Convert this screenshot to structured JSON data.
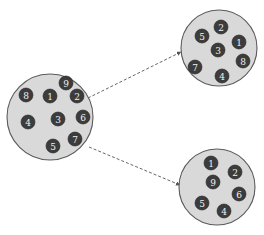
{
  "diagram": {
    "type": "cluster-partition",
    "node_radius": 7,
    "colors": {
      "cluster_fill": "#d9d9d9",
      "cluster_stroke": "#5a5a5a",
      "node_fill": "#3c3c3c",
      "node_text": "#f2f2f2",
      "edge": "#555555"
    },
    "clusters": [
      {
        "id": "source",
        "cx": 50,
        "cy": 117,
        "r": 43,
        "nodes": [
          {
            "label": "9",
            "x": 66,
            "y": 83
          },
          {
            "label": "8",
            "x": 26,
            "y": 95
          },
          {
            "label": "1",
            "x": 50,
            "y": 96
          },
          {
            "label": "2",
            "x": 77,
            "y": 96
          },
          {
            "label": "4",
            "x": 28,
            "y": 122
          },
          {
            "label": "3",
            "x": 58,
            "y": 119
          },
          {
            "label": "6",
            "x": 83,
            "y": 117
          },
          {
            "label": "7",
            "x": 75,
            "y": 139
          },
          {
            "label": "5",
            "x": 53,
            "y": 146
          }
        ]
      },
      {
        "id": "target-top",
        "cx": 219,
        "cy": 48,
        "r": 38,
        "nodes": [
          {
            "label": "2",
            "x": 221,
            "y": 27
          },
          {
            "label": "5",
            "x": 202,
            "y": 36
          },
          {
            "label": "1",
            "x": 239,
            "y": 42
          },
          {
            "label": "3",
            "x": 218,
            "y": 50
          },
          {
            "label": "8",
            "x": 243,
            "y": 61
          },
          {
            "label": "7",
            "x": 195,
            "y": 67
          },
          {
            "label": "4",
            "x": 222,
            "y": 76
          }
        ]
      },
      {
        "id": "target-bottom",
        "cx": 217,
        "cy": 187,
        "r": 38,
        "nodes": [
          {
            "label": "1",
            "x": 211,
            "y": 163
          },
          {
            "label": "2",
            "x": 235,
            "y": 172
          },
          {
            "label": "9",
            "x": 213,
            "y": 182
          },
          {
            "label": "6",
            "x": 239,
            "y": 194
          },
          {
            "label": "5",
            "x": 202,
            "y": 203
          },
          {
            "label": "4",
            "x": 224,
            "y": 211
          }
        ]
      }
    ],
    "edges": [
      {
        "from": "source",
        "to": "target-top",
        "x1": 88,
        "y1": 98,
        "x2": 181,
        "y2": 52,
        "style": "dashed",
        "arrow": true
      },
      {
        "from": "source",
        "to": "target-bottom",
        "x1": 89,
        "y1": 147,
        "x2": 180,
        "y2": 185,
        "style": "dashed",
        "arrow": true
      }
    ]
  }
}
